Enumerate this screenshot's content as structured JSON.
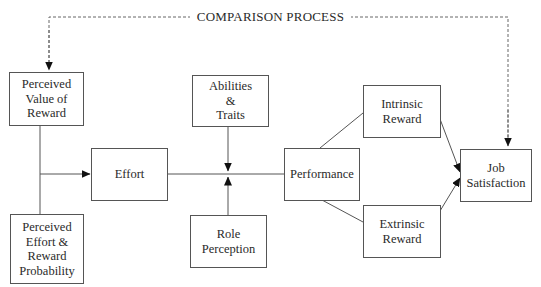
{
  "diagram": {
    "type": "flowchart",
    "comparison_label": "COMPARISON PROCESS",
    "nodes": {
      "perceived_value": {
        "lines": [
          "Perceived",
          "Value of",
          "Reward"
        ]
      },
      "perceived_effort": {
        "lines": [
          "Perceived",
          "Effort &",
          "Reward",
          "Probability"
        ]
      },
      "effort": {
        "lines": [
          "Effort"
        ]
      },
      "abilities": {
        "lines": [
          "Abilities",
          "&",
          "Traits"
        ]
      },
      "role": {
        "lines": [
          "Role",
          "Perception"
        ]
      },
      "performance": {
        "lines": [
          "Performance"
        ]
      },
      "intrinsic": {
        "lines": [
          "Intrinsic",
          "Reward"
        ]
      },
      "extrinsic": {
        "lines": [
          "Extrinsic",
          "Reward"
        ]
      },
      "job_satisfaction": {
        "lines": [
          "Job",
          "Satisfaction"
        ]
      }
    },
    "edges": [
      {
        "from": "perceived_value",
        "to": "effort",
        "style": "solid"
      },
      {
        "from": "perceived_effort",
        "to": "effort",
        "style": "solid"
      },
      {
        "from": "effort",
        "to": "performance",
        "style": "solid"
      },
      {
        "from": "abilities",
        "to": "effort-performance link",
        "style": "solid arrow"
      },
      {
        "from": "role",
        "to": "effort-performance link",
        "style": "solid arrow"
      },
      {
        "from": "performance",
        "to": "intrinsic",
        "style": "solid"
      },
      {
        "from": "performance",
        "to": "extrinsic",
        "style": "solid"
      },
      {
        "from": "intrinsic",
        "to": "job_satisfaction",
        "style": "solid arrow"
      },
      {
        "from": "extrinsic",
        "to": "job_satisfaction",
        "style": "solid arrow"
      },
      {
        "from": "comparison_process",
        "to": "perceived_value",
        "style": "dashed arrow"
      },
      {
        "from": "comparison_process",
        "to": "job_satisfaction",
        "style": "dashed arrow"
      }
    ],
    "colors": {
      "line": "#555555",
      "text": "#2a2a2a",
      "background": "#ffffff"
    }
  }
}
